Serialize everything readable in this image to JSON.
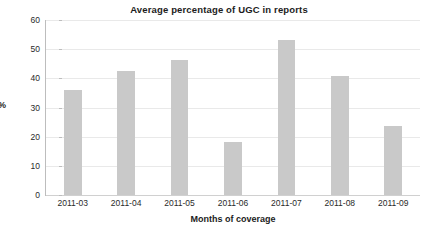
{
  "chart_data": {
    "type": "bar",
    "title": "Average percentage of UGC in reports",
    "xlabel": "Months of coverage",
    "ylabel": "%",
    "categories": [
      "2011-03",
      "2011-04",
      "2011-05",
      "2011-06",
      "2011-07",
      "2011-08",
      "2011-09"
    ],
    "values": [
      36,
      42.5,
      46.3,
      18.2,
      53,
      40.8,
      23.5
    ],
    "ylim": [
      0,
      60
    ],
    "ytick_labels": [
      "0",
      "10",
      "20",
      "30",
      "40",
      "50",
      "60"
    ],
    "ytick_values": [
      0,
      10,
      20,
      30,
      40,
      50,
      60
    ],
    "grid": true,
    "grid_axis": "y",
    "legend": false,
    "legend_position": "none",
    "bar_color": "#c9c9c9",
    "grid_color": "#e9e9e9",
    "axis_color": "#bdbdbd",
    "text_color": "#1c1c1c",
    "background_color": "#ffffff"
  }
}
